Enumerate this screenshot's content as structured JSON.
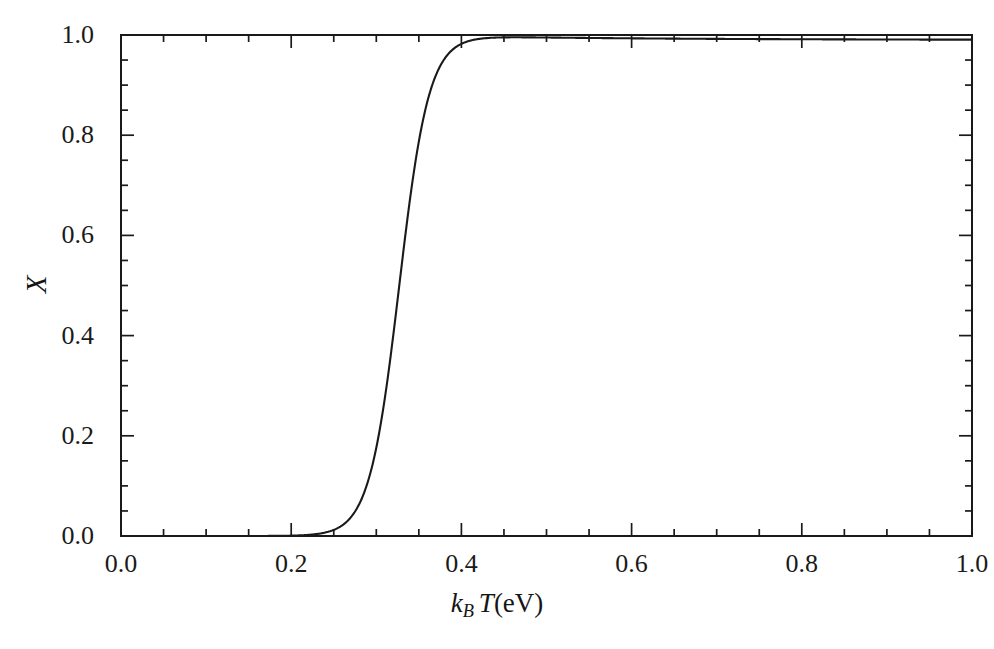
{
  "figure": {
    "background_color": "#ffffff",
    "line_color": "#1a1a1a",
    "axis_color": "#1a1a1a"
  },
  "axes": {
    "x_title_parts": {
      "k": "k",
      "sub_b": "B",
      "t": "T",
      "units": "(eV)"
    },
    "x_title_text": "k_B T(eV)",
    "y_title_text": "X"
  },
  "chart_data": {
    "type": "line",
    "title": "",
    "subtitle": "",
    "xlabel": "k_B T(eV)",
    "ylabel": "X",
    "xlim": [
      0.0,
      1.0
    ],
    "ylim": [
      0.0,
      1.0
    ],
    "grid": false,
    "legend_position": "none",
    "x_ticks": [
      0.0,
      0.2,
      0.4,
      0.6,
      0.8,
      1.0
    ],
    "x_tick_labels": [
      "0.0",
      "0.2",
      "0.4",
      "0.6",
      "0.8",
      "1.0"
    ],
    "y_ticks": [
      0.0,
      0.2,
      0.4,
      0.6,
      0.8,
      1.0
    ],
    "y_tick_labels": [
      "0.0",
      "0.2",
      "0.4",
      "0.6",
      "0.8",
      "1.0"
    ],
    "x_minor_tick_step": 0.05,
    "y_minor_tick_step": 0.05,
    "tick_direction": "in",
    "series": [
      {
        "name": "X",
        "description": "sigmoidal ionization/dissociation fraction vs thermal energy",
        "midpoint_x": 0.327,
        "width_parameter": 0.0175,
        "x": [
          0.0,
          0.05,
          0.1,
          0.15,
          0.18,
          0.2,
          0.22,
          0.24,
          0.25,
          0.26,
          0.27,
          0.28,
          0.285,
          0.29,
          0.295,
          0.3,
          0.305,
          0.31,
          0.315,
          0.32,
          0.325,
          0.327,
          0.33,
          0.335,
          0.34,
          0.345,
          0.35,
          0.355,
          0.36,
          0.365,
          0.37,
          0.375,
          0.38,
          0.385,
          0.39,
          0.4,
          0.41,
          0.42,
          0.44,
          0.46,
          0.5,
          0.55,
          0.6,
          0.7,
          0.8,
          0.9,
          1.0
        ],
        "y": [
          0.0,
          0.0,
          0.0,
          0.0,
          0.0,
          0.0,
          0.001,
          0.002,
          0.003,
          0.005,
          0.009,
          0.016,
          0.021,
          0.028,
          0.037,
          0.048,
          0.063,
          0.082,
          0.106,
          0.136,
          0.173,
          0.5,
          0.266,
          0.325,
          0.391,
          0.462,
          0.533,
          0.603,
          0.668,
          0.726,
          0.776,
          0.819,
          0.854,
          0.883,
          0.906,
          0.941,
          0.963,
          0.976,
          0.988,
          0.993,
          0.996,
          0.997,
          0.998,
          0.998,
          0.999,
          0.999,
          0.99
        ]
      }
    ],
    "notes": {
      "onset_x": 0.25,
      "saturation_x": 0.4,
      "saturation_y": 0.99
    }
  },
  "caption_fragment": "",
  "ticklabels": {
    "y": [
      "1.0",
      "0.8",
      "0.6",
      "0.4",
      "0.2",
      "0.0"
    ],
    "x": [
      "0.0",
      "0.2",
      "0.4",
      "0.6",
      "0.8",
      "1.0"
    ]
  }
}
